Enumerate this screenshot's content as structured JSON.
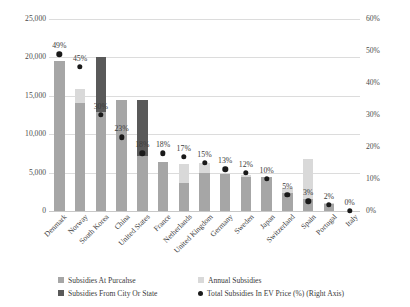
{
  "chart_data": {
    "type": "bar",
    "title": "",
    "subtitle": "",
    "xlabel": "",
    "ylabel": "EURO per Vehicle",
    "y2label": "",
    "ylim": [
      0,
      25000
    ],
    "y2lim": [
      0,
      60
    ],
    "grid": true,
    "legend_position": "bottom",
    "y_ticks": [
      "0",
      "5,000",
      "10,000",
      "15,000",
      "20,000",
      "25,000"
    ],
    "y_tick_values": [
      0,
      5000,
      10000,
      15000,
      20000,
      25000
    ],
    "y2_ticks": [
      "0%",
      "10%",
      "20%",
      "30%",
      "40%",
      "50%",
      "60%"
    ],
    "y2_tick_values": [
      0,
      10,
      20,
      30,
      40,
      50,
      60
    ],
    "categories": [
      "Denmark",
      "Norway",
      "South Korea",
      "China",
      "United States",
      "France",
      "Netherlands",
      "United Kingdom",
      "Germany",
      "Sweden",
      "Japan",
      "Switzerland",
      "Spain",
      "Portugal",
      "Italy"
    ],
    "series": [
      {
        "name": "Subsidies At Purcahse",
        "color": "#a6a6a6",
        "values": [
          19500,
          14000,
          12900,
          14500,
          7200,
          6350,
          3700,
          5000,
          4800,
          4450,
          4400,
          2400,
          1600,
          900,
          0
        ]
      },
      {
        "name": "Annual Subsidies",
        "color": "#d9d9d9",
        "values": [
          0,
          1900,
          0,
          0,
          0,
          0,
          2450,
          1300,
          200,
          200,
          0,
          600,
          5200,
          200,
          0
        ]
      },
      {
        "name": "Subsidies From City Or State",
        "color": "#595959",
        "values": [
          0,
          0,
          7100,
          0,
          7300,
          0,
          0,
          0,
          0,
          0,
          0,
          0,
          0,
          0,
          0
        ]
      }
    ],
    "scatter_series": {
      "name": "Total Subsidies In EV Price (%) (Right Axis)",
      "color": "#1a1a1a",
      "axis": "right",
      "values": [
        49,
        45,
        30,
        23,
        18,
        18,
        17,
        15,
        13,
        12,
        10,
        5,
        3,
        2,
        0
      ],
      "labels": [
        "49%",
        "45%",
        "30%",
        "23%",
        "18%",
        "18%",
        "17%",
        "15%",
        "13%",
        "12%",
        "10%",
        "5%",
        "3%",
        "2%",
        "0%"
      ]
    },
    "legend": [
      {
        "label": "Subsidies At Purcahse",
        "marker": "square",
        "color": "#a6a6a6"
      },
      {
        "label": "Annual Subsidies",
        "marker": "square",
        "color": "#d9d9d9"
      },
      {
        "label": "Subsidies From City Or State",
        "marker": "square",
        "color": "#595959"
      },
      {
        "label": "Total Subsidies In EV Price (%) (Right Axis)",
        "marker": "circle",
        "color": "#1a1a1a"
      }
    ]
  }
}
